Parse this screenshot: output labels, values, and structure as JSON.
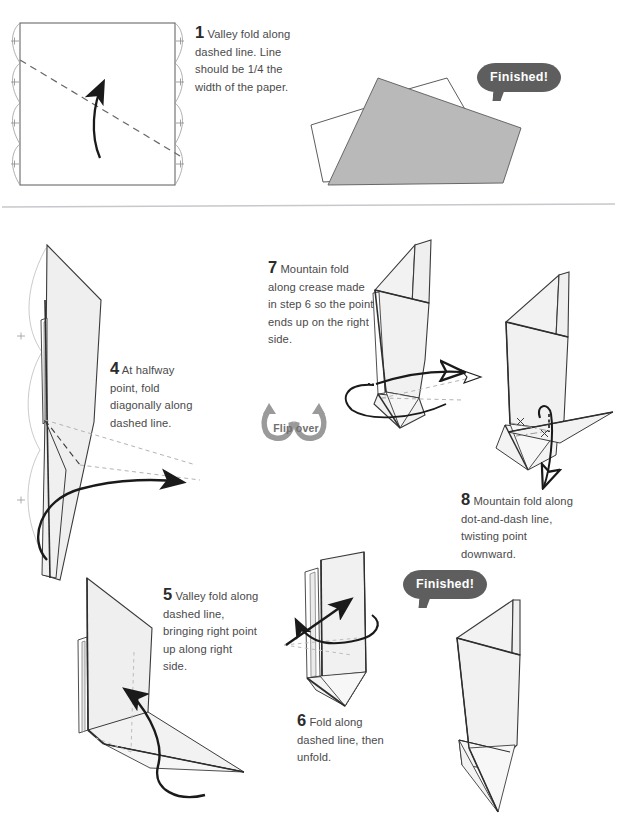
{
  "page": {
    "background_color": "#ffffff",
    "divider_color": "#c8c8cc"
  },
  "colors": {
    "paper_fill": "#efefef",
    "paper_fill_light": "#f4f4f4",
    "paper_stroke": "#3a3a3a",
    "outline_stroke": "#2e2e2e",
    "dashed_line": "#6b6b6b",
    "dotted_line": "#b0b0b0",
    "arrow": "#1a1a1a",
    "badge_bg": "#5e5e5e",
    "badge_text": "#ffffff",
    "flip_icon": "#9a9a9a",
    "flip_label": "#6f6f6f",
    "body_text": "#4a4a4a",
    "number_text": "#2b2b2b",
    "shaded_shape": "#b9b9b9"
  },
  "steps": [
    {
      "id": "step-1",
      "number": "1",
      "text": "Valley fold along dashed line. Line should be 1/4 the width of the paper."
    },
    {
      "id": "step-4",
      "number": "4",
      "text": "At halfway point, fold diagonally along dashed line."
    },
    {
      "id": "step-5",
      "number": "5",
      "text": "Valley fold along dashed line, bringing right point up along right side."
    },
    {
      "id": "step-6",
      "number": "6",
      "text": "Fold along dashed line, then unfold."
    },
    {
      "id": "step-7",
      "number": "7",
      "text": "Mountain fold along crease made in step 6 so the point ends up on the right side."
    },
    {
      "id": "step-8",
      "number": "8",
      "text": "Mountain fold along dot-and-dash line, twisting point downward."
    }
  ],
  "badges": [
    {
      "id": "finished-top",
      "label": "Finished!"
    },
    {
      "id": "finished-bottom",
      "label": "Finished!"
    }
  ],
  "flip_over": {
    "label": "Flip over",
    "icon_name": "flip-over-icon"
  },
  "diagrams": [
    {
      "id": "diagram-step-1",
      "name": "pleated-square-with-valley-fold"
    },
    {
      "id": "diagram-finished-top",
      "name": "finished-folded-shape-shaded"
    },
    {
      "id": "diagram-step-4",
      "name": "tall-folded-sheet-diagonal-crease"
    },
    {
      "id": "diagram-step-5",
      "name": "folded-sheet-with-base-flap"
    },
    {
      "id": "diagram-step-6",
      "name": "narrow-upright-model"
    },
    {
      "id": "diagram-step-7",
      "name": "upright-model-with-rotation-arrow"
    },
    {
      "id": "diagram-step-8",
      "name": "model-with-twist-arrow"
    },
    {
      "id": "diagram-finished-bottom",
      "name": "final-origami-figure"
    }
  ]
}
